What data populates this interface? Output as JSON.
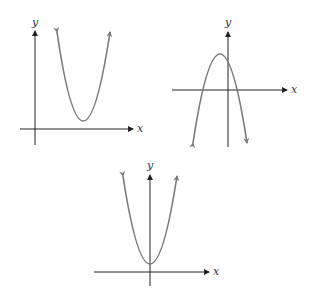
{
  "figure": {
    "colors": {
      "axis": "#222222",
      "curve": "#7a7a7a",
      "background": "#ffffff"
    },
    "graphs": [
      {
        "id": "graph-1",
        "x_label": "x",
        "y_label": "y",
        "shape": "parabola opening upward, vertex above x-axis, right of y-axis"
      },
      {
        "id": "graph-2",
        "x_label": "x",
        "y_label": "y",
        "shape": "parabola opening downward, vertex above x-axis, left of y-axis"
      },
      {
        "id": "graph-3",
        "x_label": "x",
        "y_label": "y",
        "shape": "parabola opening upward, vertex on y-axis above x-axis"
      }
    ]
  }
}
